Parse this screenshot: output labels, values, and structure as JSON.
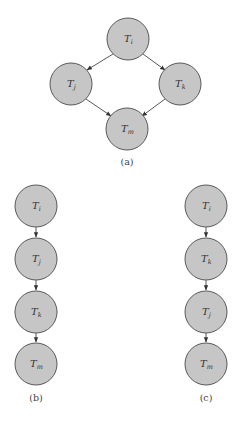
{
  "colors": {
    "node_fill": "#c6c6c6",
    "node_stroke": "#5a5a5a",
    "edge": "#444444",
    "background": "#ffffff"
  },
  "diagrams": [
    {
      "caption": "(a)",
      "nodes": [
        {
          "id": "Ti",
          "base": "T",
          "sub": "i",
          "x": 128,
          "y": 39
        },
        {
          "id": "Tj",
          "base": "T",
          "sub": "j",
          "x": 71,
          "y": 84
        },
        {
          "id": "Tk",
          "base": "T",
          "sub": "k",
          "x": 180,
          "y": 84
        },
        {
          "id": "Tm",
          "base": "T",
          "sub": "m",
          "x": 127,
          "y": 129
        }
      ],
      "edges": [
        [
          "Ti",
          "Tj"
        ],
        [
          "Ti",
          "Tk"
        ],
        [
          "Tj",
          "Tm"
        ],
        [
          "Tk",
          "Tm"
        ]
      ]
    },
    {
      "caption": "(b)",
      "nodes": [
        {
          "id": "Ti",
          "base": "T",
          "sub": "i",
          "x": 36,
          "y": 206
        },
        {
          "id": "Tj",
          "base": "T",
          "sub": "j",
          "x": 36,
          "y": 259
        },
        {
          "id": "Tk",
          "base": "T",
          "sub": "k",
          "x": 36,
          "y": 312
        },
        {
          "id": "Tm",
          "base": "T",
          "sub": "m",
          "x": 36,
          "y": 364
        }
      ],
      "edges": [
        [
          "Ti",
          "Tj"
        ],
        [
          "Tj",
          "Tk"
        ],
        [
          "Tk",
          "Tm"
        ]
      ]
    },
    {
      "caption": "(c)",
      "nodes": [
        {
          "id": "Ti",
          "base": "T",
          "sub": "i",
          "x": 206,
          "y": 206
        },
        {
          "id": "Tk",
          "base": "T",
          "sub": "k",
          "x": 206,
          "y": 259
        },
        {
          "id": "Tj",
          "base": "T",
          "sub": "j",
          "x": 206,
          "y": 312
        },
        {
          "id": "Tm",
          "base": "T",
          "sub": "m",
          "x": 206,
          "y": 364
        }
      ],
      "edges": [
        [
          "Ti",
          "Tk"
        ],
        [
          "Tk",
          "Tj"
        ],
        [
          "Tj",
          "Tm"
        ]
      ]
    }
  ]
}
